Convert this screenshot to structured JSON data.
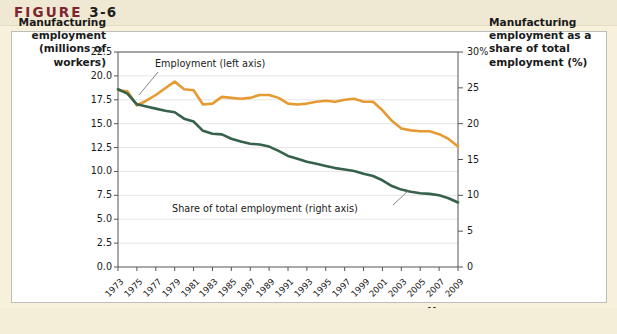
{
  "figure": {
    "label": "FIGURE",
    "number": "3-6"
  },
  "chart_data": {
    "type": "line",
    "title": "",
    "xlabel": "Year",
    "left_axis_label": "Manufacturing employment (millions of workers)",
    "right_axis_label": "Manufacturing employment as a share of total employment (%)",
    "grid": true,
    "legend_position": "inline-annotations",
    "x": [
      1973,
      1974,
      1975,
      1976,
      1977,
      1978,
      1979,
      1980,
      1981,
      1982,
      1983,
      1984,
      1985,
      1986,
      1987,
      1988,
      1989,
      1990,
      1991,
      1992,
      1993,
      1994,
      1995,
      1996,
      1997,
      1998,
      1999,
      2000,
      2001,
      2002,
      2003,
      2004,
      2005,
      2006,
      2007,
      2008,
      2009
    ],
    "xtick_labels": [
      "1973",
      "1975",
      "1977",
      "1979",
      "1981",
      "1983",
      "1985",
      "1987",
      "1989",
      "1991",
      "1993",
      "1995",
      "1997",
      "1999",
      "2001",
      "2003",
      "2005",
      "2007",
      "2009"
    ],
    "left_ylim": [
      0.0,
      22.5
    ],
    "left_yticks": [
      "0.0",
      "2.5",
      "5.0",
      "7.5",
      "10.0",
      "12.5",
      "15.0",
      "17.5",
      "20.0",
      "22.5"
    ],
    "right_ylim": [
      0,
      30
    ],
    "right_yticks": [
      "0",
      "5",
      "10",
      "15",
      "20",
      "25",
      "30%"
    ],
    "series": [
      {
        "name": "Employment (left axis)",
        "axis": "left",
        "color": "#e59a32",
        "annotation": "Employment (left axis)",
        "values": [
          18.5,
          18.4,
          16.9,
          17.4,
          18.0,
          18.7,
          19.4,
          18.6,
          18.5,
          17.0,
          17.1,
          17.8,
          17.7,
          17.6,
          17.7,
          18.0,
          18.0,
          17.7,
          17.1,
          17.0,
          17.1,
          17.3,
          17.4,
          17.3,
          17.5,
          17.6,
          17.3,
          17.3,
          16.4,
          15.3,
          14.5,
          14.3,
          14.2,
          14.2,
          13.9,
          13.4,
          12.6
        ]
      },
      {
        "name": "Share of total employment (right axis)",
        "axis": "right",
        "color": "#36614a",
        "annotation": "Share of total employment (right axis)",
        "values": [
          24.8,
          24.2,
          22.7,
          22.4,
          22.1,
          21.8,
          21.6,
          20.7,
          20.3,
          19.0,
          18.6,
          18.5,
          17.9,
          17.5,
          17.2,
          17.1,
          16.8,
          16.2,
          15.5,
          15.1,
          14.7,
          14.4,
          14.1,
          13.8,
          13.6,
          13.4,
          13.0,
          12.7,
          12.1,
          11.3,
          10.8,
          10.5,
          10.3,
          10.2,
          10.0,
          9.6,
          9.0
        ]
      }
    ]
  }
}
